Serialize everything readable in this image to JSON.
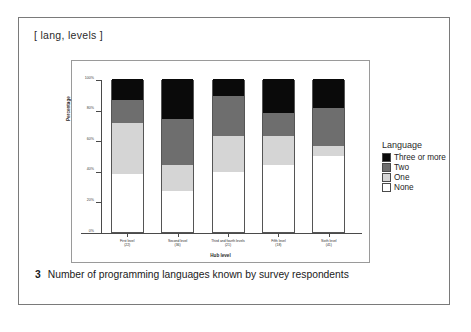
{
  "figure": {
    "header_tag": "[ lang, levels ]",
    "caption_number": "3",
    "caption_text": "Number of programming languages known by survey respondents"
  },
  "chart_data": {
    "type": "bar",
    "subtype": "stacked-percentage-column",
    "title": "",
    "xlabel": "Hub level",
    "ylabel": "Percentage",
    "ylim": [
      0,
      100
    ],
    "ytick_labels": [
      "0%",
      "20%",
      "40%",
      "60%",
      "80%",
      "100%"
    ],
    "ytick_values": [
      0,
      20,
      40,
      60,
      80,
      100
    ],
    "grid": false,
    "legend_title": "Language",
    "legend_position": "right",
    "categories": [
      "First level",
      "Second level",
      "Third and fourth levels",
      "Fifth level",
      "Sixth level"
    ],
    "category_counts": [
      "(22)",
      "(36)",
      "(21)",
      "(18)",
      "(41)"
    ],
    "series": [
      {
        "name": "None",
        "color": "#ffffff",
        "values": [
          38,
          27,
          39,
          44,
          50
        ]
      },
      {
        "name": "One",
        "color": "#d5d5d5",
        "values": [
          33,
          17,
          24,
          19,
          6
        ]
      },
      {
        "name": "Two",
        "color": "#6e6e6e",
        "values": [
          15,
          30,
          26,
          15,
          25
        ]
      },
      {
        "name": "Three or more",
        "color": "#0a0a0a",
        "values": [
          14,
          26,
          11,
          22,
          19
        ]
      }
    ],
    "legend_entries": [
      {
        "label": "Three or more",
        "color": "#0a0a0a"
      },
      {
        "label": "Two",
        "color": "#6e6e6e"
      },
      {
        "label": "One",
        "color": "#d5d5d5"
      },
      {
        "label": "None",
        "color": "#ffffff"
      }
    ]
  }
}
